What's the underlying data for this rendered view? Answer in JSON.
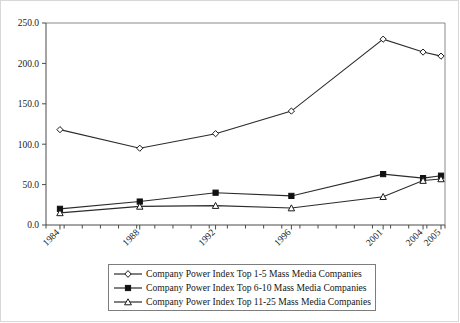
{
  "chart_data": {
    "type": "line",
    "title": "",
    "subtitle": "",
    "xlabel": "",
    "ylabel": "",
    "categories": [
      "1984",
      "1988",
      "1992",
      "1996",
      "2001",
      "2004",
      "2005"
    ],
    "x_tick_labels": [
      "1984",
      "1988",
      "1992",
      "1996",
      "2001",
      "2004",
      "2005"
    ],
    "x_tick_rotation_deg": 45,
    "y_tick_labels": [
      "0.0",
      "50.0",
      "100.0",
      "150.0",
      "200.0",
      "250.0"
    ],
    "y_tick_values": [
      0,
      50,
      100,
      150,
      200,
      250
    ],
    "ylim": [
      0,
      250
    ],
    "grid": false,
    "legend_position": "below-plot",
    "minor_x_ticks": true,
    "series": [
      {
        "name": "Company Power Index Top 1-5 Mass Media Companies",
        "marker": "open-diamond",
        "values": [
          118,
          95,
          113,
          141,
          230,
          214,
          209
        ]
      },
      {
        "name": "Company Power Index Top 6-10 Mass Media Companies",
        "marker": "filled-square",
        "values": [
          20,
          29,
          40,
          36,
          63,
          58,
          61
        ]
      },
      {
        "name": "Company Power Index Top 11-25 Mass Media Companies",
        "marker": "open-triangle",
        "values": [
          15,
          23,
          24,
          21,
          35,
          55,
          57
        ]
      }
    ]
  },
  "legend": {
    "items": [
      {
        "label": "Company Power Index Top 1-5 Mass Media Companies",
        "marker": "open-diamond"
      },
      {
        "label": "Company Power Index Top 6-10 Mass Media Companies",
        "marker": "filled-square"
      },
      {
        "label": "Company Power Index Top 11-25 Mass Media Companies",
        "marker": "open-triangle"
      }
    ]
  },
  "colors": {
    "line": "#2b2b2b",
    "axis": "#4a4a4a",
    "frame": "#8a8a8a",
    "text": "#1a1a1a",
    "background": "#ffffff"
  }
}
